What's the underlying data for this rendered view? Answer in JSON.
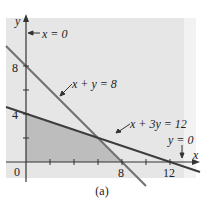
{
  "figure": {
    "caption": "(a)",
    "colors": {
      "background": "#e6e6e6",
      "strip": "#f2f2f2",
      "feasible_region": "#bdbdbd",
      "line_x_plus_y": "#6f6f6f",
      "line_x_plus_3y": "#3d3d3d",
      "axis": "#333333"
    },
    "axes": {
      "x_label": "x",
      "y_label": "y",
      "origin_label": "0",
      "x_ticks": [
        2,
        4,
        6,
        8,
        10,
        12
      ],
      "y_ticks": [
        2,
        4,
        6,
        8
      ],
      "x_tick_labels": [
        {
          "value": 8,
          "text": "8"
        },
        {
          "value": 12,
          "text": "12"
        }
      ],
      "y_tick_labels": [
        {
          "value": 4,
          "text": "4"
        },
        {
          "value": 8,
          "text": "8"
        }
      ]
    },
    "annotations": {
      "x_eq_0": "x = 0",
      "x_plus_y": "x + y = 8",
      "x_plus_3y": "x + 3y = 12",
      "y_eq_0": "y = 0"
    },
    "lines": [
      {
        "name": "x + y = 8",
        "equation": "x + y = 8"
      },
      {
        "name": "x + 3y = 12",
        "equation": "x + 3y = 12"
      }
    ],
    "feasible_region_vertices": [
      [
        0,
        0
      ],
      [
        6,
        2
      ],
      [
        0,
        4
      ],
      [
        8,
        0
      ]
    ]
  }
}
